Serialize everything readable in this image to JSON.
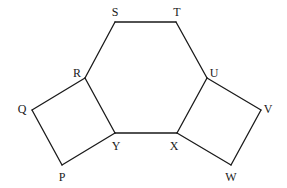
{
  "diagram": {
    "type": "geometry",
    "stroke_color": "#1a1a1a",
    "background_color": "#ffffff",
    "vertices": {
      "S": {
        "label": "S",
        "x": 115,
        "y": 22,
        "lx": 115,
        "ly": 13
      },
      "T": {
        "label": "T",
        "x": 176,
        "y": 22,
        "lx": 177,
        "ly": 13
      },
      "R": {
        "label": "R",
        "x": 85,
        "y": 78,
        "lx": 77,
        "ly": 74
      },
      "U": {
        "label": "U",
        "x": 207,
        "y": 78,
        "lx": 214,
        "ly": 74
      },
      "Y": {
        "label": "Y",
        "x": 115,
        "y": 133,
        "lx": 116,
        "ly": 147
      },
      "X": {
        "label": "X",
        "x": 177,
        "y": 133,
        "lx": 174,
        "ly": 147
      },
      "Q": {
        "label": "Q",
        "x": 32,
        "y": 110,
        "lx": 22,
        "ly": 110
      },
      "P": {
        "label": "P",
        "x": 62,
        "y": 165,
        "lx": 62,
        "ly": 178
      },
      "V": {
        "label": "V",
        "x": 261,
        "y": 110,
        "lx": 268,
        "ly": 110
      },
      "W": {
        "label": "W",
        "x": 231,
        "y": 165,
        "lx": 231,
        "ly": 178
      }
    },
    "shapes": [
      {
        "name": "hexagon",
        "vertices": [
          "S",
          "T",
          "U",
          "X",
          "Y",
          "R"
        ]
      },
      {
        "name": "left-square",
        "vertices": [
          "R",
          "Y",
          "P",
          "Q"
        ]
      },
      {
        "name": "right-square",
        "vertices": [
          "U",
          "V",
          "W",
          "X"
        ]
      }
    ],
    "edges": [
      [
        "S",
        "T"
      ],
      [
        "T",
        "U"
      ],
      [
        "U",
        "X"
      ],
      [
        "X",
        "Y"
      ],
      [
        "Y",
        "R"
      ],
      [
        "R",
        "S"
      ],
      [
        "R",
        "Q"
      ],
      [
        "Q",
        "P"
      ],
      [
        "P",
        "Y"
      ],
      [
        "U",
        "V"
      ],
      [
        "V",
        "W"
      ],
      [
        "W",
        "X"
      ]
    ]
  }
}
